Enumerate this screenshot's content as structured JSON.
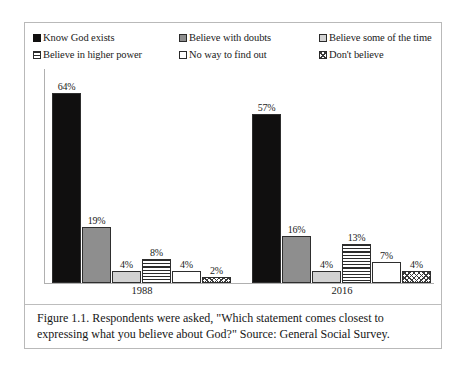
{
  "figure": {
    "caption": "Figure 1.1. Respondents were asked, \"Which statement comes closest to expressing what you believe about God?\" Source: General Social Survey."
  },
  "legend": {
    "items": [
      {
        "label": "Know God exists",
        "pattern": "solid-black",
        "color": "#100f0f"
      },
      {
        "label": "Believe with doubts",
        "pattern": "solid-gray",
        "color": "#8e8e8e"
      },
      {
        "label": "Believe some of the time",
        "pattern": "solid-light",
        "color": "#d2d2d2"
      },
      {
        "label": "Believe in higher power",
        "pattern": "horizontal-stripes",
        "color": "#2b2b2b"
      },
      {
        "label": "No way to find out",
        "pattern": "empty-white",
        "color": "#ffffff"
      },
      {
        "label": "Don't believe",
        "pattern": "diagonal-crosshatch",
        "color": "#3a3a3a"
      }
    ]
  },
  "chart_data": {
    "type": "bar",
    "title": "",
    "xlabel": "",
    "ylabel": "",
    "ylim": [
      0,
      70
    ],
    "grid": false,
    "legend_position": "top",
    "categories": [
      "1988",
      "2016"
    ],
    "series": [
      {
        "name": "Know God exists",
        "values": [
          64,
          57
        ],
        "labels": [
          "64%",
          "57%"
        ]
      },
      {
        "name": "Believe with doubts",
        "values": [
          19,
          16
        ],
        "labels": [
          "19%",
          "16%"
        ]
      },
      {
        "name": "Believe some of the time",
        "values": [
          4,
          4
        ],
        "labels": [
          "4%",
          "4%"
        ]
      },
      {
        "name": "Believe in higher power",
        "values": [
          8,
          13
        ],
        "labels": [
          "8%",
          "13%"
        ]
      },
      {
        "name": "No way to find out",
        "values": [
          4,
          7
        ],
        "labels": [
          "4%",
          "7%"
        ]
      },
      {
        "name": "Don't believe",
        "values": [
          2,
          4
        ],
        "labels": [
          "2%",
          "4%"
        ]
      }
    ]
  },
  "groups": [
    {
      "label": "1988",
      "bars": [
        {
          "value_label": "64%",
          "value": 64
        },
        {
          "value_label": "19%",
          "value": 19
        },
        {
          "value_label": "4%",
          "value": 4
        },
        {
          "value_label": "8%",
          "value": 8
        },
        {
          "value_label": "4%",
          "value": 4
        },
        {
          "value_label": "2%",
          "value": 2
        }
      ]
    },
    {
      "label": "2016",
      "bars": [
        {
          "value_label": "57%",
          "value": 57
        },
        {
          "value_label": "16%",
          "value": 16
        },
        {
          "value_label": "4%",
          "value": 4
        },
        {
          "value_label": "13%",
          "value": 13
        },
        {
          "value_label": "7%",
          "value": 7
        },
        {
          "value_label": "4%",
          "value": 4
        }
      ]
    }
  ]
}
